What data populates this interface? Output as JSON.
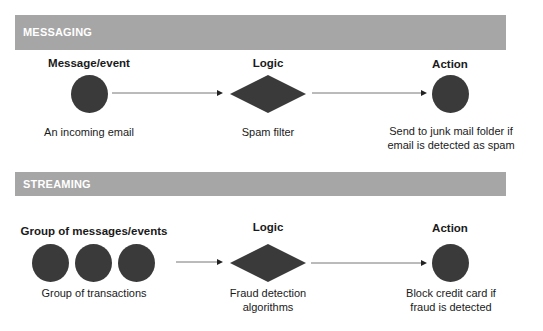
{
  "sections": [
    {
      "title": "MESSAGING",
      "columns": [
        {
          "heading": "Message/event",
          "caption": "An incoming email"
        },
        {
          "heading": "Logic",
          "caption": "Spam filter"
        },
        {
          "heading": "Action",
          "caption_lines": [
            "Send to junk mail folder if",
            "email is detected as spam"
          ]
        }
      ]
    },
    {
      "title": "STREAMING",
      "columns": [
        {
          "heading": "Group of messages/events",
          "caption": "Group of transactions"
        },
        {
          "heading": "Logic",
          "caption_lines": [
            "Fraud detection",
            "algorithms"
          ]
        },
        {
          "heading": "Action",
          "caption_lines": [
            "Block credit card if",
            "fraud is detected"
          ]
        }
      ]
    }
  ],
  "colors": {
    "bar": "#a6a6a6",
    "bar_text": "#ffffff",
    "shape_fill": "#3a3a3a",
    "arrow": "#555555"
  }
}
